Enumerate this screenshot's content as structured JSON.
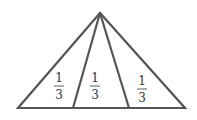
{
  "diagram": {
    "stroke_color": "#555555",
    "regions": [
      {
        "numerator": "1",
        "denominator": "3"
      },
      {
        "numerator": "1",
        "denominator": "3"
      },
      {
        "numerator": "1",
        "denominator": "3"
      }
    ]
  }
}
